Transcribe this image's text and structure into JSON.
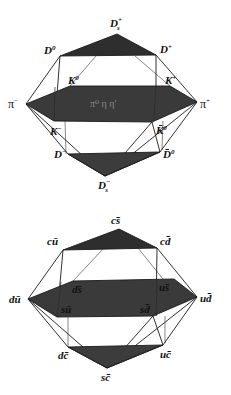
{
  "diagrams": [
    {
      "name": "meson-multiplet-charm",
      "colors": {
        "plane": "#3a3a3a",
        "top_triangle": "#2e2e2e",
        "bottom_triangle": "#3c3c3c",
        "line": "#1a1a1a"
      },
      "labels": {
        "top": {
          "base": "D",
          "sub": "s",
          "sup": "+"
        },
        "upper_left": {
          "base": "D",
          "sup": "0"
        },
        "upper_right": {
          "base": "D",
          "sup": "+"
        },
        "left": {
          "base": "π",
          "sup": "−"
        },
        "right": {
          "base": "π",
          "sup": "+"
        },
        "mid_upper_left": {
          "base": "K",
          "sup": "0"
        },
        "mid_upper_right": {
          "base": "K",
          "sup": "+"
        },
        "mid_lower_left": {
          "base": "K",
          "sup": "−"
        },
        "mid_lower_right": {
          "base": "K̄",
          "sup": "0"
        },
        "lower_left": {
          "base": "D",
          "sup": "−"
        },
        "lower_right": {
          "base": "D̄",
          "sup": "0"
        },
        "bottom": {
          "base": "D",
          "sub": "s",
          "sup": "−"
        },
        "center": "π⁰ η η′"
      }
    },
    {
      "name": "quark-content-charm",
      "labels": {
        "top": "cs̄",
        "upper_left": "cū",
        "upper_right": "cd̄",
        "left": "dū",
        "right": "ud̄",
        "mid_upper_left": "ds̄",
        "mid_upper_right": "us̄",
        "mid_lower_left": "sū",
        "mid_lower_right": "sd̄",
        "lower_left": "dc̄",
        "lower_right": "uc̄",
        "bottom": "sc̄"
      }
    }
  ]
}
